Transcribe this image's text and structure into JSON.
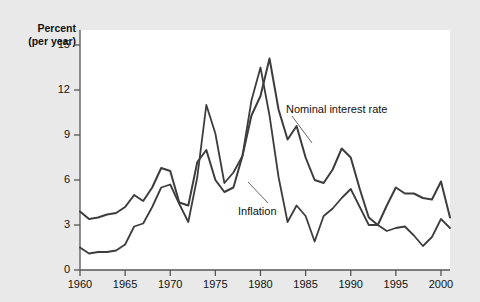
{
  "figure": {
    "background_color": "#e9e9e9",
    "plot_background_color": "#ffffff",
    "line_color": "#3d3d3d"
  },
  "axis": {
    "y_title_line1": "Percent",
    "y_title_line2": "(per year)",
    "y_ticks": [
      "0",
      "3",
      "6",
      "9",
      "12",
      "15"
    ],
    "x_ticks": [
      "1960",
      "1965",
      "1970",
      "1975",
      "1980",
      "1985",
      "1990",
      "1995",
      "2000"
    ]
  },
  "labels": {
    "nominal": "Nominal interest rate",
    "inflation": "Inflation"
  },
  "chart_data": {
    "type": "line",
    "title": "",
    "xlabel": "",
    "ylabel": "Percent (per year)",
    "xlim": [
      1960,
      2001
    ],
    "ylim": [
      0,
      16
    ],
    "yticks": [
      0,
      3,
      6,
      9,
      12,
      15
    ],
    "xticks": [
      1960,
      1965,
      1970,
      1975,
      1980,
      1985,
      1990,
      1995,
      2000
    ],
    "grid": false,
    "legend": "inline-annotations",
    "x": [
      1960,
      1961,
      1962,
      1963,
      1964,
      1965,
      1966,
      1967,
      1968,
      1969,
      1970,
      1971,
      1972,
      1973,
      1974,
      1975,
      1976,
      1977,
      1978,
      1979,
      1980,
      1981,
      1982,
      1983,
      1984,
      1985,
      1986,
      1987,
      1988,
      1989,
      1990,
      1991,
      1992,
      1993,
      1994,
      1995,
      1996,
      1997,
      1998,
      1999,
      2000,
      2001
    ],
    "series": [
      {
        "name": "Nominal interest rate",
        "values": [
          3.9,
          3.4,
          3.5,
          3.7,
          3.8,
          4.2,
          5.0,
          4.6,
          5.5,
          6.8,
          6.6,
          4.5,
          4.3,
          7.2,
          8.0,
          6.0,
          5.2,
          5.5,
          7.6,
          10.3,
          11.6,
          14.1,
          10.7,
          8.7,
          9.6,
          7.5,
          6.0,
          5.8,
          6.7,
          8.1,
          7.5,
          5.4,
          3.5,
          3.0,
          4.3,
          5.5,
          5.1,
          5.1,
          4.8,
          4.7,
          5.9,
          3.5
        ]
      },
      {
        "name": "Inflation",
        "values": [
          1.5,
          1.1,
          1.2,
          1.2,
          1.3,
          1.7,
          2.9,
          3.1,
          4.2,
          5.5,
          5.7,
          4.4,
          3.2,
          6.2,
          11.0,
          9.1,
          5.8,
          6.5,
          7.6,
          11.3,
          13.5,
          10.3,
          6.2,
          3.2,
          4.3,
          3.6,
          1.9,
          3.6,
          4.1,
          4.8,
          5.4,
          4.2,
          3.0,
          3.0,
          2.6,
          2.8,
          2.9,
          2.3,
          1.6,
          2.2,
          3.4,
          2.8
        ]
      }
    ]
  }
}
